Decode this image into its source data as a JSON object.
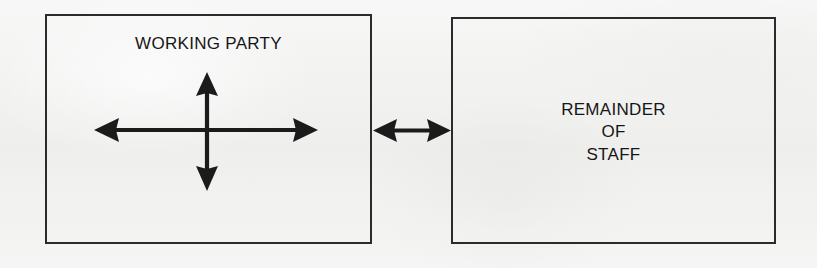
{
  "diagram": {
    "type": "block-relationship-diagram",
    "background_color": "#f2f2f1",
    "stroke_color": "#2b2b2b",
    "text_color": "#161616",
    "boxes": [
      {
        "id": "working-party",
        "label": "WORKING PARTY",
        "label_position": "top-center",
        "contains": "four-way-cross-arrow"
      },
      {
        "id": "remainder-of-staff",
        "label": "REMAINDER\nOF\nSTAFF",
        "label_lines": [
          "REMAINDER",
          "OF",
          "STAFF"
        ],
        "label_position": "center"
      }
    ],
    "arrows": [
      {
        "id": "cross-arrow",
        "icon": "four-way-arrow-icon",
        "heads": "double-ended-both-axes",
        "directions": [
          "up",
          "down",
          "left",
          "right"
        ],
        "located_in": "working-party"
      },
      {
        "id": "connector-arrow",
        "icon": "bidirectional-arrow-icon",
        "heads": "double-ended",
        "directions": [
          "left",
          "right"
        ],
        "connects": [
          "working-party",
          "remainder-of-staff"
        ]
      }
    ]
  }
}
